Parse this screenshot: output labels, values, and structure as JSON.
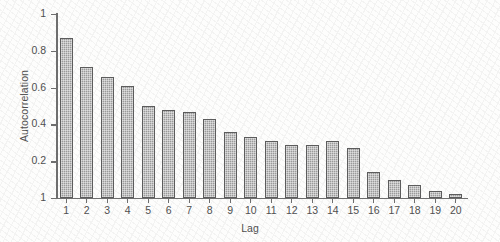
{
  "chart_data": {
    "type": "bar",
    "title": "",
    "xlabel": "Lag",
    "ylabel": "Autocorrelation",
    "categories": [
      "1",
      "2",
      "3",
      "4",
      "5",
      "6",
      "7",
      "8",
      "9",
      "10",
      "11",
      "12",
      "13",
      "14",
      "15",
      "16",
      "17",
      "18",
      "19",
      "20"
    ],
    "values": [
      0.87,
      0.71,
      0.66,
      0.61,
      0.5,
      0.48,
      0.47,
      0.43,
      0.36,
      0.33,
      0.31,
      0.29,
      0.29,
      0.31,
      0.27,
      0.14,
      0.1,
      0.07,
      0.04,
      0.02
    ],
    "ylim": [
      0,
      1
    ],
    "xlim": [
      0.4,
      20.6
    ],
    "ytick_labels": [
      "1",
      "0.8",
      "0.6",
      "0.4",
      "0.2",
      "1"
    ],
    "ytick_values": [
      1,
      0.8,
      0.6,
      0.4,
      0.2,
      0
    ],
    "xtick_labels": [
      "1",
      "2",
      "3",
      "4",
      "5",
      "6",
      "7",
      "8",
      "9",
      "10",
      "11",
      "12",
      "13",
      "14",
      "15",
      "16",
      "17",
      "18",
      "19",
      "20"
    ],
    "grid": false,
    "legend": null,
    "bar_fill_color": "#9a9a9a",
    "bar_edge_color": "#5c5c5c",
    "axis_color": "#6e6e6e",
    "background_color": "#fdfdfc"
  }
}
